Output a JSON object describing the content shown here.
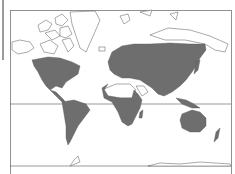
{
  "figure": {
    "type": "world-distribution-map",
    "projection": "mercator",
    "colors": {
      "range_fill": "#6e6e6e",
      "outline": "#555555",
      "background": "#ffffff",
      "frame": "#777777"
    },
    "equator_line": true,
    "shaded_regions": [
      "North America (southern Canada, USA, Mexico)",
      "Central America",
      "South America",
      "Europe",
      "Asia (excluding Arabian interior)",
      "Africa (excluding Sahara)",
      "Southeast Asia islands",
      "Australia",
      "New Zealand",
      "Japan"
    ],
    "unshaded_regions": [
      "Arctic Canada",
      "Greenland",
      "Sahara",
      "Arabian Peninsula",
      "Antarctica"
    ]
  }
}
